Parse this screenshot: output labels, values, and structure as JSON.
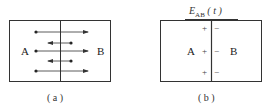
{
  "panels": [
    {
      "id": "a",
      "caption": "( a )",
      "left_label": "A",
      "right_label": "B",
      "arrows": [
        {
          "direction": "right",
          "y": 32
        },
        {
          "direction": "left",
          "y": 43
        },
        {
          "direction": "right",
          "y": 51
        },
        {
          "direction": "left",
          "y": 61
        },
        {
          "direction": "right",
          "y": 71
        }
      ]
    },
    {
      "id": "b",
      "caption": "( b )",
      "title_main": "E",
      "title_sub": "AB",
      "title_arg": "( t )",
      "left_label": "A",
      "right_label": "B",
      "left_signs": [
        "+",
        "+",
        "+"
      ],
      "right_signs": [
        "−",
        "−",
        "−"
      ]
    }
  ],
  "colors": {
    "line": "#333333",
    "text": "#222222"
  }
}
